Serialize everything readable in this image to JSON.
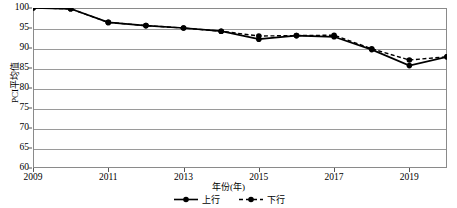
{
  "chart_data": {
    "type": "line",
    "title": "",
    "subtitle": "",
    "xlabel": "年份(年)",
    "ylabel": "PCI平均值",
    "x": [
      2009,
      2010,
      2011,
      2012,
      2013,
      2014,
      2015,
      2016,
      2017,
      2018,
      2019,
      2020
    ],
    "xtick_labels": [
      "2009",
      "2011",
      "2013",
      "2015",
      "2017",
      "2019"
    ],
    "xticks": [
      2009,
      2011,
      2013,
      2015,
      2017,
      2019
    ],
    "ytick_labels": [
      "60",
      "65",
      "70",
      "75",
      "80",
      "85",
      "90",
      "95",
      "100"
    ],
    "yticks": [
      60,
      65,
      70,
      75,
      80,
      85,
      90,
      95,
      100
    ],
    "xlim": [
      2009,
      2020
    ],
    "ylim": [
      60,
      100
    ],
    "grid": "horizontal",
    "legend_position": "bottom-center",
    "series": [
      {
        "name": "上行",
        "style": "solid",
        "marker": "filled-circle",
        "color": "#000000",
        "values": [
          100.0,
          99.8,
          96.4,
          95.6,
          95.0,
          94.2,
          92.2,
          93.1,
          92.8,
          89.6,
          85.6,
          87.8
        ]
      },
      {
        "name": "下行",
        "style": "dashed",
        "marker": "filled-circle",
        "color": "#000000",
        "values": [
          100.0,
          99.8,
          96.4,
          95.6,
          95.0,
          94.2,
          93.0,
          93.1,
          93.2,
          89.8,
          87.0,
          87.8
        ]
      }
    ]
  },
  "axes": {
    "y_title": "PCI平均值",
    "x_title": "年份(年)"
  },
  "legend": {
    "items": [
      {
        "label": "上行",
        "style": "solid"
      },
      {
        "label": "下行",
        "style": "dashed"
      }
    ]
  },
  "colors": {
    "line": "#000000",
    "grid": "#9a9a9a",
    "frame": "#8a8a8a",
    "text": "#000000",
    "background": "#ffffff"
  }
}
